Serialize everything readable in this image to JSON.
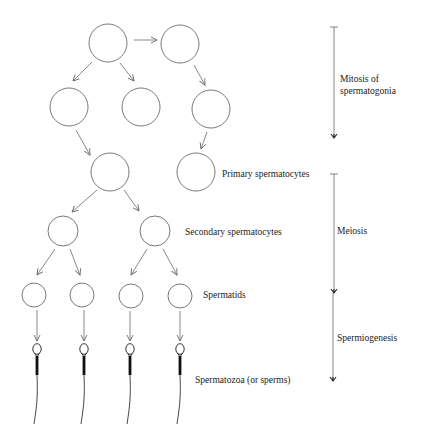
{
  "diagram": {
    "colors": {
      "stroke": "#6a6a6a",
      "text": "#222222",
      "sperm_midpiece": "#111111",
      "background": "#ffffff"
    },
    "stage_labels": {
      "primary": "Primary spermatocytes",
      "secondary": "Secondary spermatocytes",
      "spermatids": "Spermatids",
      "spermatozoa": "Spermatozoa (or sperms)"
    },
    "phase_labels": {
      "mitosis_line1": "Mitosis of",
      "mitosis_line2": "spermatogonia",
      "meiosis": "Meiosis",
      "spermiogenesis": "Spermiogenesis"
    },
    "cells": {
      "spermatogonia": [
        {
          "cx": 108,
          "cy": 43,
          "r": 19
        },
        {
          "cx": 180,
          "cy": 44,
          "r": 19
        },
        {
          "cx": 69,
          "cy": 107,
          "r": 19
        },
        {
          "cx": 141,
          "cy": 107,
          "r": 19
        },
        {
          "cx": 211,
          "cy": 109,
          "r": 19
        }
      ],
      "primary_spermatocytes": [
        {
          "cx": 110,
          "cy": 172,
          "r": 19
        },
        {
          "cx": 196,
          "cy": 172,
          "r": 19
        }
      ],
      "secondary_spermatocytes": [
        {
          "cx": 63,
          "cy": 231,
          "r": 15
        },
        {
          "cx": 155,
          "cy": 231,
          "r": 15
        }
      ],
      "spermatids": [
        {
          "cx": 34,
          "cy": 295,
          "r": 12
        },
        {
          "cx": 82,
          "cy": 295,
          "r": 12
        },
        {
          "cx": 131,
          "cy": 296,
          "r": 12
        },
        {
          "cx": 180,
          "cy": 296,
          "r": 12
        }
      ],
      "spermatozoa_x": [
        36,
        83,
        130,
        180
      ]
    }
  }
}
